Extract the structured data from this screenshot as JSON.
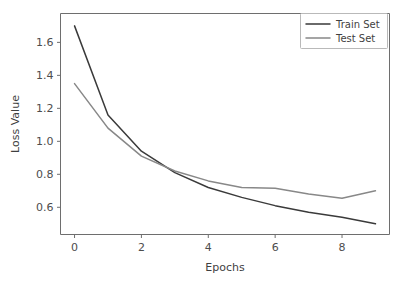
{
  "chart_data": {
    "type": "line",
    "title": "",
    "xlabel": "Epochs",
    "ylabel": "Loss Value",
    "x": [
      0,
      1,
      2,
      3,
      4,
      5,
      6,
      7,
      8,
      9
    ],
    "series": [
      {
        "name": "Train Set",
        "color": "#3a3a3a",
        "values": [
          1.7,
          1.16,
          0.94,
          0.81,
          0.72,
          0.66,
          0.61,
          0.57,
          0.54,
          0.5
        ]
      },
      {
        "name": "Test Set",
        "color": "#888888",
        "values": [
          1.35,
          1.08,
          0.91,
          0.82,
          0.76,
          0.72,
          0.715,
          0.68,
          0.655,
          0.7
        ]
      }
    ],
    "xlim": [
      -0.42,
      9.42
    ],
    "ylim": [
      0.435,
      1.775
    ],
    "xticks": [
      0,
      2,
      4,
      6,
      8
    ],
    "xtick_labels": [
      "0",
      "2",
      "4",
      "6",
      "8"
    ],
    "yticks": [
      0.6,
      0.8,
      1.0,
      1.2,
      1.4,
      1.6
    ],
    "ytick_labels": [
      "0.6",
      "0.8",
      "1.0",
      "1.2",
      "1.4",
      "1.6"
    ],
    "grid": false,
    "legend_position": "upper right",
    "legend_entries": [
      "Train Set",
      "Test Set"
    ]
  }
}
